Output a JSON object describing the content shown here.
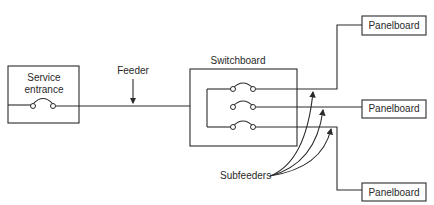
{
  "diagram": {
    "type": "electrical-distribution-one-line",
    "labels": {
      "service_entrance_line1": "Service",
      "service_entrance_line2": "entrance",
      "feeder": "Feeder",
      "switchboard": "Switchboard",
      "subfeeders": "Subfeeders",
      "panelboard_top": "Panelboard",
      "panelboard_middle": "Panelboard",
      "panelboard_bottom": "Panelboard"
    },
    "nodes": [
      {
        "id": "service-entrance",
        "label": "Service entrance",
        "breakers": 1
      },
      {
        "id": "switchboard",
        "label": "Switchboard",
        "breakers": 3
      },
      {
        "id": "panelboard-1",
        "label": "Panelboard"
      },
      {
        "id": "panelboard-2",
        "label": "Panelboard"
      },
      {
        "id": "panelboard-3",
        "label": "Panelboard"
      }
    ],
    "edges": [
      {
        "from": "service-entrance",
        "to": "switchboard",
        "label": "Feeder"
      },
      {
        "from": "switchboard",
        "to": "panelboard-1",
        "label": "Subfeeder"
      },
      {
        "from": "switchboard",
        "to": "panelboard-2",
        "label": "Subfeeder"
      },
      {
        "from": "switchboard",
        "to": "panelboard-3",
        "label": "Subfeeder"
      }
    ],
    "colors": {
      "line": "#2a2a2a",
      "background": "#ffffff"
    }
  }
}
